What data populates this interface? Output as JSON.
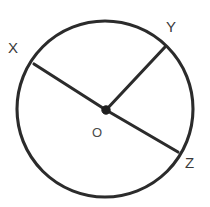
{
  "figure": {
    "kind": "circle-with-radii",
    "background_color": "#ffffff",
    "stroke_color": "#2b2b2b",
    "label_color": "#3a3a3a",
    "center_dot_color": "#1f1f1f",
    "circle": {
      "cx": 105,
      "cy": 109,
      "r": 88,
      "stroke_width": 3.1
    },
    "center": {
      "label": "O",
      "x": 106,
      "y": 110,
      "dot_radius": 4.2,
      "label_x": 92,
      "label_y": 126
    },
    "points": [
      {
        "label": "X",
        "point_x": 34,
        "point_y": 64,
        "label_x": 8,
        "label_y": 40
      },
      {
        "label": "Y",
        "point_x": 165,
        "point_y": 47,
        "label_x": 166,
        "label_y": 19
      },
      {
        "label": "Z",
        "point_x": 178,
        "point_y": 152,
        "label_x": 185,
        "label_y": 155
      }
    ],
    "segments": [
      {
        "name": "radius-ox",
        "from": "O",
        "to": "X"
      },
      {
        "name": "radius-oy",
        "from": "O",
        "to": "Y"
      },
      {
        "name": "radius-oz",
        "from": "O",
        "to": "Z"
      }
    ],
    "notes": {
      "diameter": "XZ",
      "collinear": "X-O-Z"
    }
  }
}
